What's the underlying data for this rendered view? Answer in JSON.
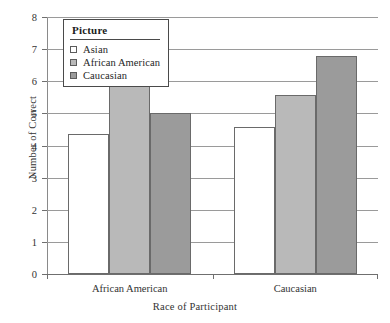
{
  "chart_data": {
    "type": "bar",
    "title": "",
    "xlabel": "Race of Participant",
    "ylabel": "Number of Correct",
    "categories": [
      "African American",
      "Caucasian"
    ],
    "series": [
      {
        "name": "Asian",
        "values": [
          4.35,
          4.58
        ],
        "color": "#ffffff"
      },
      {
        "name": "African American",
        "values": [
          6.0,
          5.57
        ],
        "color": "#b9b9b9"
      },
      {
        "name": "Caucasian",
        "values": [
          5.02,
          6.78
        ],
        "color": "#9b9b9b"
      }
    ],
    "ylim": [
      0,
      8
    ],
    "yticks": [
      0,
      1,
      2,
      3,
      4,
      5,
      6,
      7,
      8
    ],
    "grid": true,
    "legend": {
      "title": "Picture",
      "position": "top-left-inside",
      "entries": [
        "Asian",
        "African American",
        "Caucasian"
      ]
    }
  },
  "axis": {
    "ylabel": "Number of Correct",
    "xlabel": "Race of Participant",
    "yticklabels": [
      "8",
      "7",
      "6",
      "5",
      "4",
      "3",
      "2",
      "1",
      "0"
    ],
    "xticklabels": [
      "African American",
      "Caucasian"
    ]
  },
  "legend": {
    "title": "Picture",
    "items": [
      {
        "label": "Asian",
        "color": "#ffffff"
      },
      {
        "label": "African American",
        "color": "#b9b9b9"
      },
      {
        "label": "Caucasian",
        "color": "#9b9b9b"
      }
    ]
  },
  "colors": {
    "bar_edge": "#6a6a6a",
    "gridline": "#9a9a9a",
    "axis": "#6f6f6f",
    "text": "#333333"
  }
}
